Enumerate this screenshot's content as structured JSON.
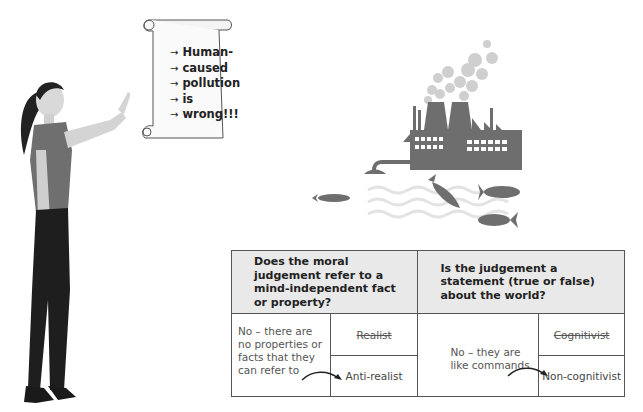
{
  "scroll": {
    "lines": [
      "Human-",
      "caused",
      "pollution",
      "is",
      "wrong!!!"
    ],
    "bullet": "→"
  },
  "illustrations": {
    "person": "woman-pointing",
    "factory": "polluting-factory",
    "fish_count": 4
  },
  "table": {
    "headers": [
      "Does the moral judgement refer to a mind-independent fact or property?",
      "Is the judgement a statement (true or false) about the world?"
    ],
    "col1": {
      "answer": "No – there are no properties or facts that they can refer to",
      "rejected": "Realist",
      "result": "Anti-realist"
    },
    "col2": {
      "answer": "No – they are like commands",
      "rejected": "Cognitivist",
      "result": "Non-cognitivist"
    }
  },
  "colors": {
    "header_bg": "#e9e9e9",
    "border": "#555555",
    "factory_gray": "#6e6e6e",
    "smoke_gray": "#c8c8c8",
    "water": "#e3e3e3"
  }
}
